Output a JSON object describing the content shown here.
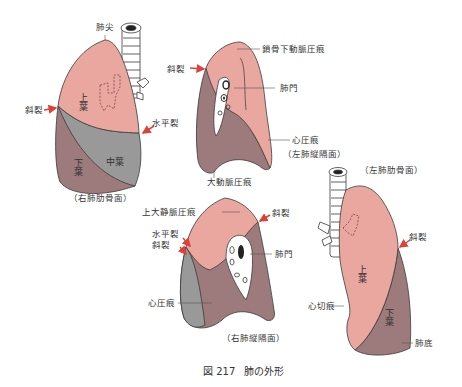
{
  "figure": {
    "number": "図 217",
    "title": "肺の外形"
  },
  "colors": {
    "upper_lobe": "#e9a7a0",
    "lower_lobe": "#9d7a7b",
    "middle_lobe": "#999999",
    "outline": "#3a3a3a",
    "arrow": "#e0403a",
    "hilum": "#ffffff",
    "text": "#333333"
  },
  "views": [
    {
      "id": "right-costal",
      "caption": "（右肺肋骨面）",
      "labels": {
        "apex": "肺尖",
        "oblique_fissure": "斜裂",
        "horizontal_fissure": "水平裂"
      },
      "lobes": {
        "upper": "上葉",
        "middle": "中葉",
        "lower": "下葉"
      }
    },
    {
      "id": "left-mediastinal",
      "caption": "（左肺縦隔面）",
      "labels": {
        "subclavian_groove": "鎖骨下動脈圧痕",
        "oblique_fissure": "斜裂",
        "hilum": "肺門",
        "cardiac_impression": "心圧痕",
        "aortic_groove": "大動脈圧痕"
      }
    },
    {
      "id": "right-mediastinal",
      "caption": "（右肺縦隔面）",
      "labels": {
        "svc_groove": "上大静脈圧痕",
        "oblique_fissure_right": "斜裂",
        "horizontal_fissure": "水平裂",
        "oblique_fissure_left": "斜裂",
        "hilum": "肺門",
        "cardiac_impression": "心圧痕"
      }
    },
    {
      "id": "left-costal",
      "caption": "（左肺肋骨面）",
      "labels": {
        "oblique_fissure": "斜裂",
        "cardiac_notch": "心切痕",
        "base": "肺底"
      },
      "lobes": {
        "upper": "上葉",
        "lower": "下葉"
      }
    }
  ]
}
